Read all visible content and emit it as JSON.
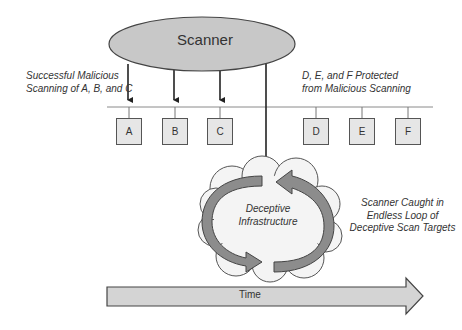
{
  "scanner": {
    "label": "Scanner",
    "fill": "#c8c8c8"
  },
  "labels": {
    "successful": [
      "Successful Malicious",
      "Scanning of A, B, and C"
    ],
    "protected": [
      "D, E, and F Protected",
      "from Malicious Scanning"
    ],
    "caught": [
      "Scanner Caught in",
      "Endless Loop of",
      "Deceptive Scan Targets"
    ],
    "deceptive": [
      "Deceptive",
      "Infrastructure"
    ]
  },
  "hosts": {
    "scanned": [
      "A",
      "B",
      "C"
    ],
    "protected": [
      "D",
      "E",
      "F"
    ]
  },
  "timeline": {
    "label": "Time",
    "fill": "#d4d4d4"
  }
}
